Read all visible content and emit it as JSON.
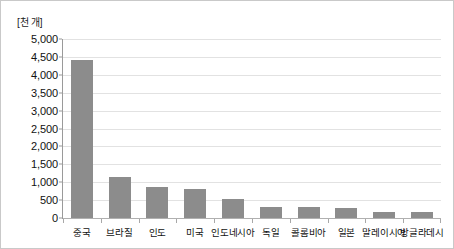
{
  "chart_data": {
    "type": "bar",
    "title": "",
    "subtitle": "",
    "unit_label": "[천 개]",
    "xlabel": "",
    "ylabel": "",
    "ylim": [
      0,
      5000
    ],
    "ytick_step": 500,
    "grid": true,
    "legend": "none",
    "orientation": "vertical",
    "bar_color": "#8c8c8c",
    "categories": [
      "중국",
      "브라질",
      "인도",
      "미국",
      "인도네시아",
      "독일",
      "콜롬비아",
      "일본",
      "말레이시아",
      "방글라데시"
    ],
    "values": [
      4400,
      1150,
      880,
      800,
      530,
      300,
      300,
      290,
      180,
      170
    ],
    "ytick_labels": [
      "5,000",
      "4,500",
      "4,000",
      "3,500",
      "3,000",
      "2,500",
      "2,000",
      "1,500",
      "1,000",
      "500",
      "0"
    ],
    "ytick_values": [
      5000,
      4500,
      4000,
      3500,
      3000,
      2500,
      2000,
      1500,
      1000,
      500,
      0
    ]
  },
  "colors": {
    "bar": "#8c8c8c",
    "gridline": "#e2e2e2",
    "axis": "#9a9a9a",
    "text": "#111111",
    "border": "#c9c9c9",
    "background": "#ffffff"
  }
}
